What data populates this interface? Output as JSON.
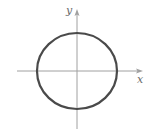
{
  "diagram": {
    "type": "coordinate-plot",
    "shape": "circle",
    "axes": {
      "x_label": "x",
      "y_label": "y",
      "color": "#a0a0a0"
    },
    "curve": {
      "color": "#4a4a4a",
      "stroke_width": 2.2
    }
  }
}
